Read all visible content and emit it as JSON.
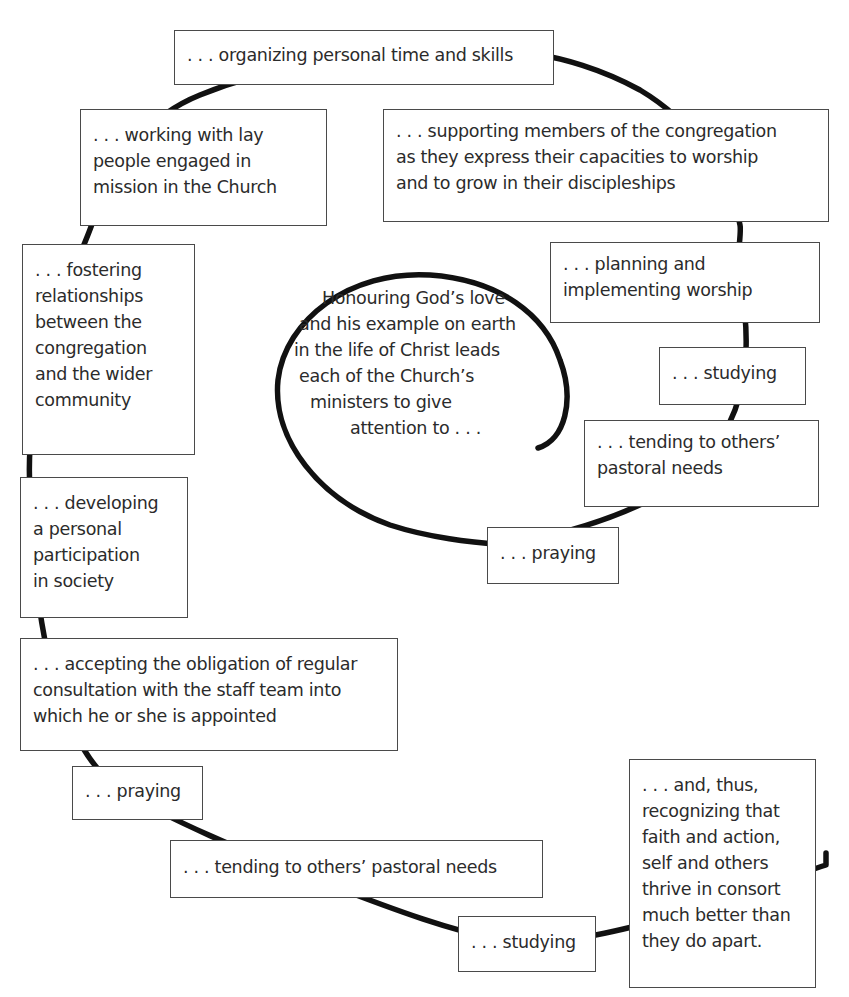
{
  "diagram": {
    "type": "spiral-of-boxes",
    "center": {
      "lines": [
        "Honouring God’s love",
        "and his example on earth",
        "in the life of Christ leads",
        "each of the Church’s",
        "ministers to give",
        "attention to . . ."
      ]
    },
    "boxes": [
      {
        "id": "praying-inner",
        "lines": [
          ". . . praying"
        ]
      },
      {
        "id": "tending-inner",
        "lines": [
          ". . . tending to others’",
          "pastoral needs"
        ]
      },
      {
        "id": "studying-inner",
        "lines": [
          ". . . studying"
        ]
      },
      {
        "id": "planning-worship",
        "lines": [
          ". . . planning and",
          "implementing worship"
        ]
      },
      {
        "id": "supporting-members",
        "lines": [
          ". . . supporting members of the congregation",
          "as they express their capacities to worship",
          "and to grow in their discipleships"
        ]
      },
      {
        "id": "organizing-time",
        "lines": [
          ". . . organizing personal time and skills"
        ]
      },
      {
        "id": "working-lay-people",
        "lines": [
          ". . . working with lay",
          "people engaged in",
          "mission in the Church"
        ]
      },
      {
        "id": "fostering-relationships",
        "lines": [
          ". . . fostering",
          "relationships",
          "between the",
          "congregation",
          "and the wider",
          "community"
        ]
      },
      {
        "id": "developing-participation",
        "lines": [
          ". . . developing",
          "a personal",
          "participation",
          "in society"
        ]
      },
      {
        "id": "accepting-obligation",
        "lines": [
          ". . . accepting the obligation of regular",
          "consultation with the staff team into",
          "which he or she is appointed"
        ]
      },
      {
        "id": "praying-outer",
        "lines": [
          ". . . praying"
        ]
      },
      {
        "id": "tending-outer",
        "lines": [
          ". . . tending to others’ pastoral needs"
        ]
      },
      {
        "id": "studying-outer",
        "lines": [
          ". . . studying"
        ]
      },
      {
        "id": "recognizing-faith-action",
        "lines": [
          ". . . and, thus,",
          "recognizing that",
          "faith and action,",
          "self and others",
          "thrive in consort",
          "much better than",
          "they do apart."
        ]
      }
    ],
    "colors": {
      "line": "#111111",
      "box_border": "#4a4a4a",
      "text": "#2b2b2b",
      "background": "#ffffff"
    }
  }
}
